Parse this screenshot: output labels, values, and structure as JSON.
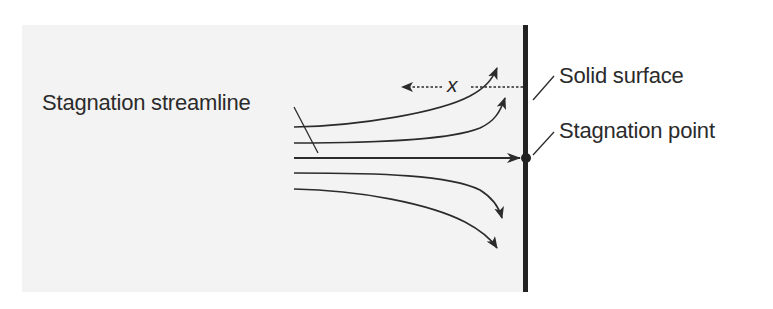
{
  "figure": {
    "labels": {
      "stagnation_streamline": "Stagnation streamline",
      "solid_surface": "Solid surface",
      "stagnation_point": "Stagnation point",
      "distance_symbol": "x"
    },
    "colors": {
      "background": "#ffffff",
      "panel": "#f3f3f3",
      "line": "#2b2b2b",
      "wall": "#222222"
    },
    "streamlines": [
      {
        "id": "upper-outer",
        "direction": "deflects up"
      },
      {
        "id": "upper-inner",
        "direction": "deflects up"
      },
      {
        "id": "center",
        "direction": "straight to stagnation point"
      },
      {
        "id": "lower-inner",
        "direction": "deflects down"
      },
      {
        "id": "lower-outer",
        "direction": "deflects down"
      }
    ]
  }
}
